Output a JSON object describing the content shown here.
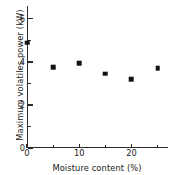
{
  "chart_data": {
    "type": "scatter",
    "title": "",
    "xlabel": "Moisture content (%)",
    "ylabel": "Maximum volatiles power (kW)",
    "xlim": [
      0,
      27
    ],
    "ylim": [
      0,
      6.6
    ],
    "grid": false,
    "legend": null,
    "marker_style": "filled-square",
    "marker_color": "#111111",
    "x": [
      0,
      5,
      10,
      15,
      20,
      25
    ],
    "values": [
      4.9,
      3.75,
      3.95,
      3.45,
      3.2,
      3.7
    ],
    "points": [
      {
        "x": 0,
        "y": 4.9
      },
      {
        "x": 5,
        "y": 3.75
      },
      {
        "x": 10,
        "y": 3.95
      },
      {
        "x": 15,
        "y": 3.45
      },
      {
        "x": 20,
        "y": 3.2
      },
      {
        "x": 25,
        "y": 3.7
      }
    ],
    "xaxis": {
      "major_ticks": [
        0,
        10,
        20
      ],
      "major_tick_labels": [
        "0",
        "10",
        "20"
      ],
      "minor_ticks": [
        5,
        15,
        25
      ]
    },
    "yaxis": {
      "major_ticks": [
        0,
        2,
        4,
        6
      ],
      "major_tick_labels": [
        "0",
        "2",
        "4",
        "6"
      ],
      "minor_ticks": [
        1,
        3,
        5
      ]
    }
  }
}
